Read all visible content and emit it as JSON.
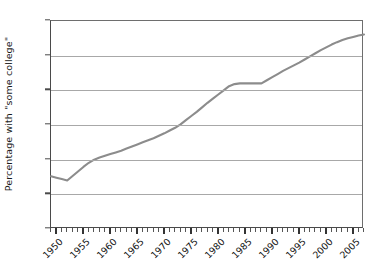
{
  "chart_data": {
    "type": "line",
    "title": "",
    "subtitle": "",
    "xlabel": "",
    "ylabel": "Percentage with \"some college\"",
    "xlim": [
      1949,
      2007
    ],
    "ylim": [
      0,
      60
    ],
    "grid": "horizontal",
    "legend": "none",
    "line_color": "#8c8c8c",
    "y_tick_labels": [
      "0%",
      "10%",
      "20%",
      "30%",
      "40%",
      "50%",
      "60%"
    ],
    "y_tick_values": [
      0,
      10,
      20,
      30,
      40,
      50,
      60
    ],
    "x_tick_labels": [
      "1950",
      "1955",
      "1960",
      "1965",
      "1970",
      "1975",
      "1980",
      "1985",
      "1990",
      "1995",
      "2000",
      "2005"
    ],
    "x_tick_values": [
      1950,
      1955,
      1960,
      1965,
      1970,
      1975,
      1980,
      1985,
      1990,
      1995,
      2000,
      2005
    ],
    "x_minor_tick_step": 1,
    "series": [
      {
        "name": "Percentage with \"some college\"",
        "x": [
          1949,
          1950,
          1951,
          1952,
          1953,
          1954,
          1955,
          1956,
          1957,
          1958,
          1959,
          1960,
          1961,
          1962,
          1963,
          1964,
          1965,
          1966,
          1967,
          1968,
          1969,
          1970,
          1971,
          1972,
          1973,
          1974,
          1975,
          1976,
          1977,
          1978,
          1979,
          1980,
          1981,
          1982,
          1983,
          1984,
          1985,
          1986,
          1987,
          1988,
          1989,
          1990,
          1991,
          1992,
          1993,
          1994,
          1995,
          1996,
          1997,
          1998,
          1999,
          2000,
          2001,
          2002,
          2003,
          2004,
          2005,
          2006,
          2007
        ],
        "y": [
          15.2,
          14.8,
          14.4,
          14.0,
          15.3,
          16.6,
          17.9,
          19.1,
          20.0,
          20.6,
          21.1,
          21.6,
          22.1,
          22.6,
          23.2,
          23.8,
          24.4,
          25.0,
          25.6,
          26.2,
          26.9,
          27.6,
          28.4,
          29.2,
          30.2,
          31.4,
          32.6,
          33.8,
          35.1,
          36.4,
          37.6,
          38.8,
          40.0,
          41.2,
          41.8,
          42.0,
          42.0,
          42.0,
          42.0,
          42.0,
          42.9,
          43.8,
          44.7,
          45.6,
          46.4,
          47.2,
          48.0,
          48.9,
          49.8,
          50.7,
          51.6,
          52.4,
          53.2,
          53.9,
          54.5,
          55.0,
          55.4,
          55.8,
          56.1
        ]
      }
    ],
    "annotations": [
      {
        "label": "start value",
        "x": 1949,
        "y": 15.2
      },
      {
        "label": "minimum",
        "x": 1952,
        "y": 14.0
      },
      {
        "label": "plateau start",
        "x": 1984,
        "y": 42.0
      },
      {
        "label": "plateau end",
        "x": 1988,
        "y": 42.0
      },
      {
        "label": "end value",
        "x": 2007,
        "y": 56.1
      }
    ]
  }
}
